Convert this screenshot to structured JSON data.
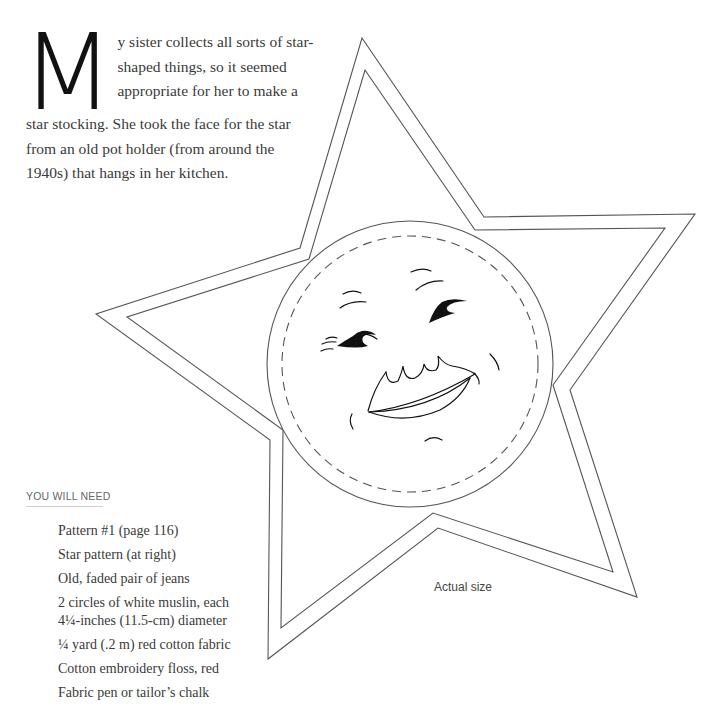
{
  "intro": {
    "drop_cap": "M",
    "lines": [
      "y sister collects all sorts of star-",
      "shaped things, so it seemed",
      "appropriate for her to make a",
      "star stocking. She took the face for the star",
      "from an old pot holder (from around the",
      "1940s) that hangs in her kitchen."
    ]
  },
  "materials": {
    "heading": "YOU WILL NEED",
    "items": [
      "Pattern #1 (page 116)",
      "Star pattern (at right)",
      "Old, faded pair of jeans",
      "2 circles of white muslin, each",
      "4¼-inches (11.5-cm) diameter",
      "¼ yard (.2 m) red cotton fabric",
      "Cotton embroidery floss, red",
      "Fabric pen or tailor’s chalk"
    ]
  },
  "pattern": {
    "caption": "Actual size",
    "stroke_color": "#555555",
    "face_color": "#111111"
  }
}
